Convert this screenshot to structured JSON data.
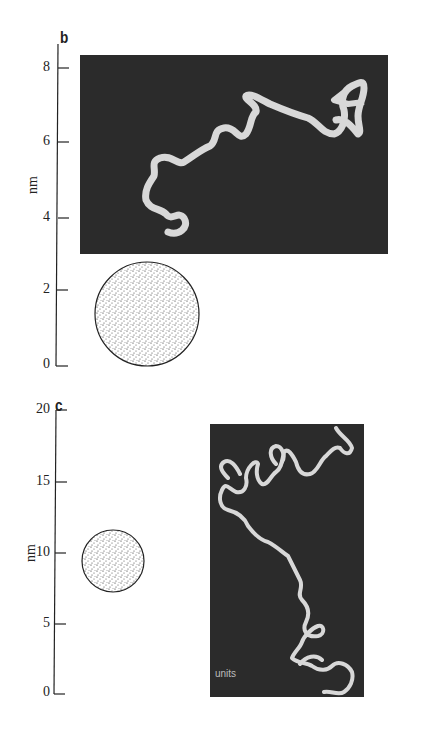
{
  "panels": [
    {
      "label": "b",
      "axis_title": "nm",
      "ticks": [
        "8",
        "6",
        "4",
        "2",
        "0"
      ],
      "image_caption": ""
    },
    {
      "label": "c",
      "axis_title": "nm",
      "ticks": [
        "20",
        "15",
        "10",
        "5",
        "0"
      ],
      "image_caption": "units"
    }
  ],
  "colors": {
    "image_background": "#2b2b2b",
    "chain": "#d8d8d8",
    "axis": "#222222"
  }
}
